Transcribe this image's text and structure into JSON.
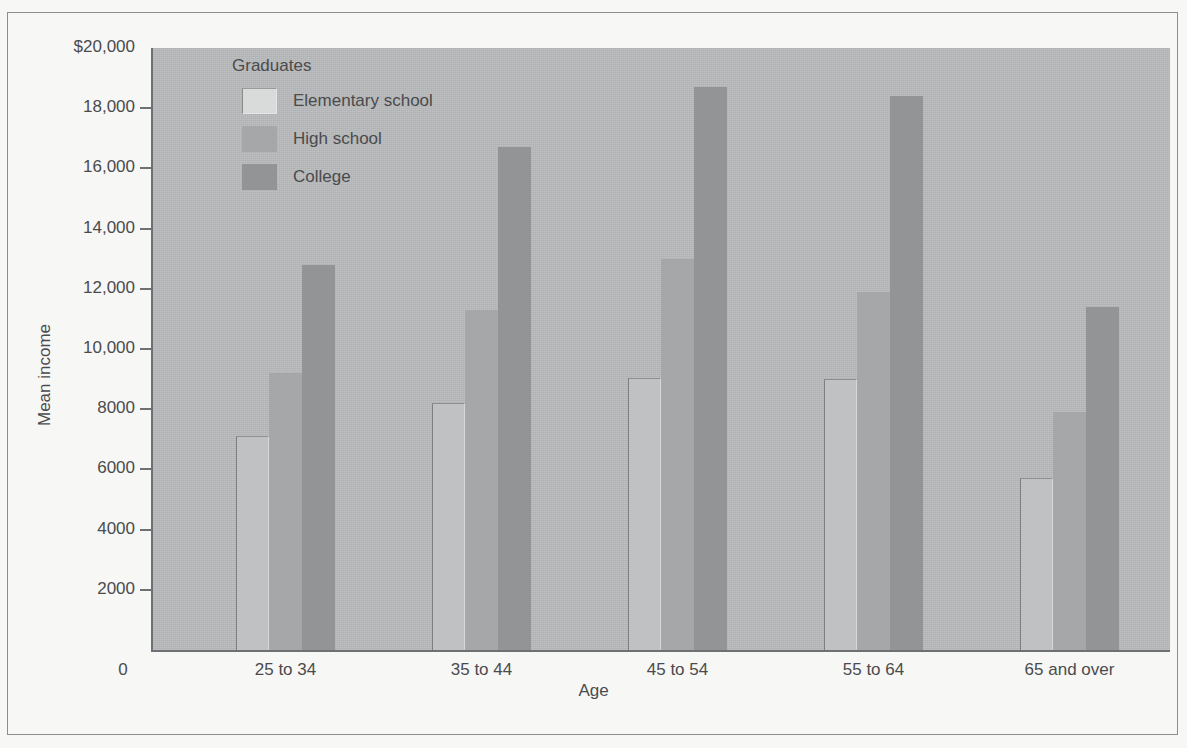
{
  "chart_data": {
    "type": "bar",
    "title": "",
    "xlabel": "Age",
    "ylabel": "Mean income",
    "categories": [
      "25 to 34",
      "35 to 44",
      "45 to 54",
      "55 to 64",
      "65 and over"
    ],
    "series": [
      {
        "name": "Elementary school",
        "values": [
          7100,
          8200,
          9050,
          9000,
          5700
        ],
        "color": "#c0c1c2"
      },
      {
        "name": "High school",
        "values": [
          9200,
          11300,
          13000,
          11900,
          7900
        ],
        "color": "#a6a7a9"
      },
      {
        "name": "College",
        "values": [
          12800,
          16700,
          18700,
          18400,
          11400
        ],
        "color": "#939496"
      }
    ],
    "ylim": [
      0,
      20000
    ],
    "yticks": [
      0,
      2000,
      4000,
      6000,
      8000,
      10000,
      12000,
      14000,
      16000,
      18000,
      20000
    ],
    "ytick_labels": [
      "0",
      "2000",
      "4000",
      "6000",
      "8000",
      "10,000",
      "12,000",
      "14,000",
      "16,000",
      "18,000",
      "$20,000"
    ],
    "grid": false,
    "legend_position": "top-left",
    "legend_title": "Graduates"
  },
  "axes": {
    "y_title": "Mean income",
    "x_title": "Age",
    "x_origin_label": "0",
    "y_labels": [
      "$20,000",
      "18,000",
      "16,000",
      "14,000",
      "12,000",
      "10,000",
      "8000",
      "6000",
      "4000",
      "2000"
    ]
  },
  "legend": {
    "title": "Graduates",
    "items": [
      {
        "label": "Elementary school",
        "key": "elementary"
      },
      {
        "label": "High school",
        "key": "highschool"
      },
      {
        "label": "College",
        "key": "college"
      }
    ]
  },
  "x_categories": [
    "25 to 34",
    "35 to 44",
    "45 to 54",
    "55 to 64",
    "65 and over"
  ],
  "colors": {
    "panel": "#b9babb",
    "page": "#f7f7f6",
    "axis": "#6f7073",
    "text": "#4a4b4d",
    "elementary": "#c0c1c2",
    "highschool": "#a6a7a9",
    "college": "#939496"
  }
}
